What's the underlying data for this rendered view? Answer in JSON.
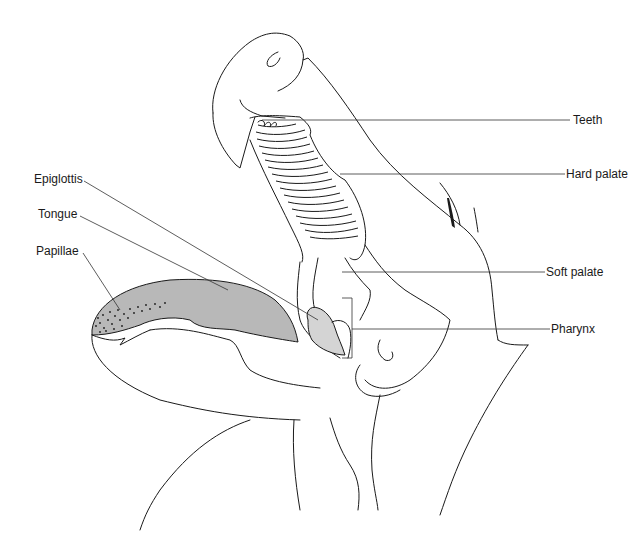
{
  "diagram": {
    "colors": {
      "line": "#1a1a1a",
      "tongue_fill": "#b8b8b8",
      "epiglottis_fill": "#d4d4d4",
      "background": "#ffffff"
    },
    "labels": {
      "teeth": "Teeth",
      "hard_palate": "Hard palate",
      "soft_palate": "Soft palate",
      "pharynx": "Pharynx",
      "epiglottis": "Epiglottis",
      "tongue": "Tongue",
      "papillae": "Papillae"
    }
  }
}
